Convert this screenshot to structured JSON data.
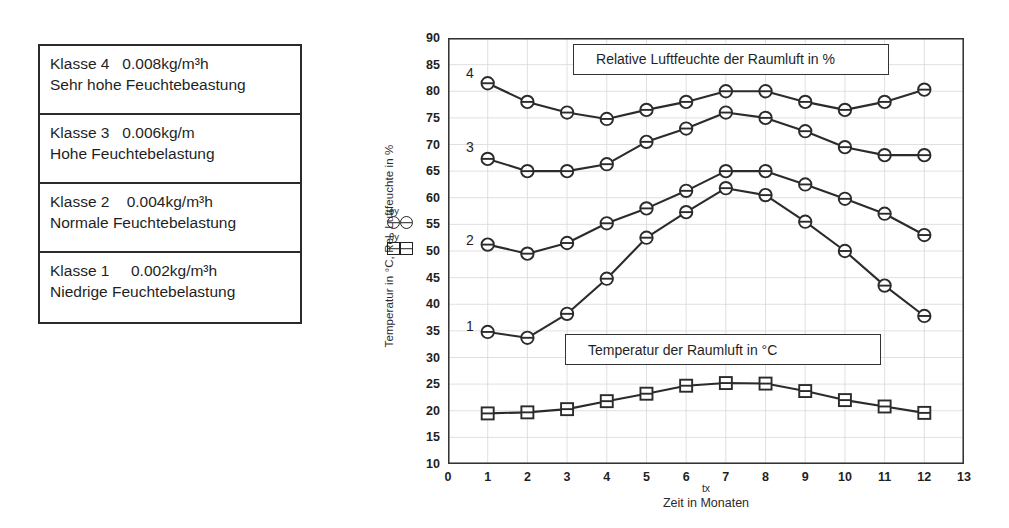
{
  "klassen_table": {
    "rows": [
      {
        "line1": "Klasse 4   0.008kg/m³h",
        "line2": "Sehr hohe Feuchtebeastung"
      },
      {
        "line1": "Klasse 3   0.006kg/m",
        "line2": "Hohe Feuchtebelastung"
      },
      {
        "line1": "Klasse 2    0.004kg/m³h",
        "line2": "Normale Feuchtebelastung"
      },
      {
        "line1": "Klasse 1     0.002kg/m³h",
        "line2": "Niedrige Feuchtebelastung"
      }
    ]
  },
  "marker_legend": {
    "humidity_symbol": "ϕy",
    "temperature_symbol": "θy"
  },
  "chart_data": {
    "type": "line",
    "title": "",
    "xlabel": "Zeit in Monaten",
    "xvar": "tx",
    "ylabel": "Temperatur in °C, Rel. Luftfeuchte in %",
    "xlim": [
      0,
      13
    ],
    "ylim": [
      10,
      90
    ],
    "xticks": [
      0,
      1,
      2,
      3,
      4,
      5,
      6,
      7,
      8,
      9,
      10,
      11,
      12,
      13
    ],
    "yticks": [
      10,
      15,
      20,
      25,
      30,
      35,
      40,
      45,
      50,
      55,
      60,
      65,
      70,
      75,
      80,
      85,
      90
    ],
    "grid": true,
    "legend_position": "none",
    "x": [
      1,
      2,
      3,
      4,
      5,
      6,
      7,
      8,
      9,
      10,
      11,
      12
    ],
    "annotations": [
      {
        "text": "Relative Luftfeuchte der Raumluft in %",
        "x": 3.15,
        "y": 86.0,
        "w": 316,
        "h": 31
      },
      {
        "text": "Temperatur der Raumluft in °C",
        "x": 2.95,
        "y": 31.5,
        "w": 316,
        "h": 31
      }
    ],
    "series": [
      {
        "name": "Klasse 4",
        "label": "4",
        "marker": "circle",
        "label_x": 0.55,
        "label_y": 83.5,
        "values": [
          81.5,
          78.0,
          76.0,
          74.8,
          76.5,
          78.0,
          80.0,
          80.0,
          78.0,
          76.5,
          78.0,
          80.3
        ]
      },
      {
        "name": "Klasse 3",
        "label": "3",
        "marker": "circle",
        "label_x": 0.55,
        "label_y": 69.5,
        "values": [
          67.3,
          65.0,
          65.0,
          66.3,
          70.5,
          73.0,
          76.0,
          75.0,
          72.5,
          69.5,
          68.0,
          68.0
        ]
      },
      {
        "name": "Klasse 2",
        "label": "2",
        "marker": "circle",
        "label_x": 0.55,
        "label_y": 52.0,
        "values": [
          51.2,
          49.5,
          51.5,
          55.2,
          58.0,
          61.3,
          65.0,
          65.0,
          62.5,
          59.8,
          57.0,
          53.0
        ]
      },
      {
        "name": "Klasse 1",
        "label": "1",
        "marker": "circle",
        "label_x": 0.55,
        "label_y": 36.0,
        "values": [
          34.8,
          33.7,
          38.2,
          44.8,
          52.5,
          57.3,
          61.8,
          60.5,
          55.5,
          50.0,
          43.5,
          37.8
        ]
      },
      {
        "name": "Temperatur",
        "label": "",
        "marker": "square",
        "label_x": null,
        "label_y": null,
        "values": [
          19.5,
          19.7,
          20.3,
          21.8,
          23.2,
          24.7,
          25.2,
          25.1,
          23.7,
          22.0,
          20.8,
          19.6
        ]
      }
    ]
  }
}
